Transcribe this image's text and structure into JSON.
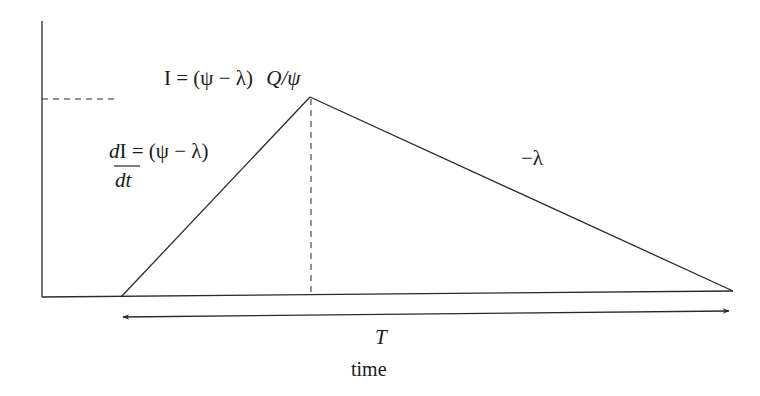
{
  "diagram": {
    "type": "inventory-triangle",
    "labels": {
      "peak_formula_prefix": "I = (ψ − λ)",
      "peak_formula_suffix": "Q/ψ",
      "slope_up_numerator_d": "d",
      "slope_up_numerator_rest": "I = (ψ − λ)",
      "slope_up_denominator": "dt",
      "slope_down": "−λ",
      "period": "T",
      "x_axis": "time"
    },
    "geometry": {
      "y_axis": {
        "x": 42,
        "y_top": 21,
        "y_bottom": 297
      },
      "x_axis": {
        "y_left": 297,
        "x_left": 42,
        "x_right": 733,
        "y_right": 291
      },
      "start_point": [
        121,
        297
      ],
      "peak_point": [
        310,
        97
      ],
      "end_point": [
        733,
        291
      ],
      "peak_dashed_horizontal": {
        "y": 99,
        "x1": 42,
        "x2": 119
      },
      "peak_dashed_vertical": {
        "x": 311,
        "y1": 97,
        "y2": 295
      },
      "period_arrow": {
        "x1": 121,
        "y1": 317,
        "x2": 731,
        "y2": 311
      }
    },
    "colors": {
      "line": "#2a2a2a",
      "background": "#ffffff"
    }
  }
}
